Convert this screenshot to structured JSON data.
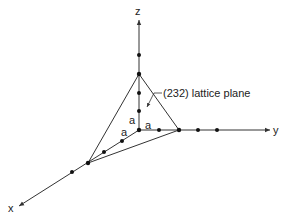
{
  "diagram": {
    "type": "crystal-lattice-axes",
    "axes": {
      "x_label": "x",
      "y_label": "y",
      "z_label": "z"
    },
    "plane_label": "(232) lattice plane",
    "spacing_labels": {
      "x_spacing": "a",
      "y_spacing": "a",
      "z_spacing": "a"
    },
    "intercepts": {
      "x": "2a",
      "y": "3a",
      "z": "2a"
    },
    "lattice_points": {
      "x_axis_count": 4,
      "y_axis_count": 4,
      "z_axis_count": 4
    },
    "colors": {
      "line": "#333333",
      "point": "#111111",
      "background": "#ffffff"
    }
  }
}
